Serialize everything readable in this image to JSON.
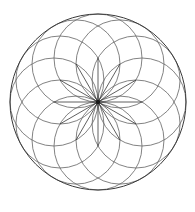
{
  "figure": {
    "background_color": "#ffffff",
    "canvas": {
      "width": 195,
      "height": 212
    }
  },
  "chart_data": {
    "type": "scatter",
    "subtitle": "",
    "xlabel": "",
    "ylabel": "",
    "grid": false,
    "legend_position": "none",
    "xlim": [
      0,
      195
    ],
    "ylim": [
      0,
      212
    ],
    "geometry": {
      "center": {
        "x": 98,
        "y": 102
      },
      "petal_count": 12,
      "petal_circle_radius": 44,
      "boundary_circle_radius": 88,
      "angle_step_degrees": 30,
      "spoke_count": 12,
      "spoke_length": 44,
      "center_dot_radius": 2.2
    },
    "colors": {
      "boundary_stroke": "#3a3a3a",
      "petal_stroke": "#6b6b6b",
      "spoke_stroke": "#2b2b2b",
      "center_dot": "#1a1a1a",
      "background": "#ffffff"
    },
    "stroke_widths": {
      "boundary": 1,
      "petal": 0.85,
      "spoke": 0.75
    },
    "categories": [
      "circle-1",
      "circle-2",
      "circle-3",
      "circle-4",
      "circle-5",
      "circle-6",
      "circle-7",
      "circle-8",
      "circle-9",
      "circle-10",
      "circle-11",
      "circle-12"
    ],
    "series": [
      {
        "name": "petal-circle-centers",
        "note": "centers of the twelve generating circles, each at radius 44 from the common center, spaced 30 degrees apart",
        "points": [
          {
            "angle": 0,
            "x": 142.0,
            "y": 102.0
          },
          {
            "angle": 30,
            "x": 136.1,
            "y": 124.0
          },
          {
            "angle": 60,
            "x": 120.0,
            "y": 140.1
          },
          {
            "angle": 90,
            "x": 98.0,
            "y": 146.0
          },
          {
            "angle": 120,
            "x": 76.0,
            "y": 140.1
          },
          {
            "angle": 150,
            "x": 59.9,
            "y": 124.0
          },
          {
            "angle": 180,
            "x": 54.0,
            "y": 102.0
          },
          {
            "angle": 210,
            "x": 59.9,
            "y": 80.0
          },
          {
            "angle": 240,
            "x": 76.0,
            "y": 63.9
          },
          {
            "angle": 270,
            "x": 98.0,
            "y": 58.0
          },
          {
            "angle": 300,
            "x": 120.0,
            "y": 63.9
          },
          {
            "angle": 330,
            "x": 136.1,
            "y": 80.0
          }
        ]
      },
      {
        "name": "spoke-endpoints",
        "note": "endpoints of the twelve radial lines converging at the common center",
        "points": [
          {
            "angle": 0,
            "x": 142.0,
            "y": 102.0
          },
          {
            "angle": 30,
            "x": 136.1,
            "y": 124.0
          },
          {
            "angle": 60,
            "x": 120.0,
            "y": 140.1
          },
          {
            "angle": 90,
            "x": 98.0,
            "y": 146.0
          },
          {
            "angle": 120,
            "x": 76.0,
            "y": 140.1
          },
          {
            "angle": 150,
            "x": 59.9,
            "y": 124.0
          },
          {
            "angle": 180,
            "x": 54.0,
            "y": 102.0
          },
          {
            "angle": 210,
            "x": 59.9,
            "y": 80.0
          },
          {
            "angle": 240,
            "x": 76.0,
            "y": 63.9
          },
          {
            "angle": 270,
            "x": 98.0,
            "y": 58.0
          },
          {
            "angle": 300,
            "x": 120.0,
            "y": 63.9
          },
          {
            "angle": 330,
            "x": 136.1,
            "y": 80.0
          }
        ]
      }
    ],
    "annotations": []
  }
}
